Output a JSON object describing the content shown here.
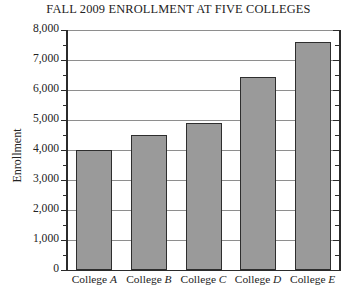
{
  "chart_data": {
    "type": "bar",
    "title": "FALL 2009 ENROLLMENT AT FIVE COLLEGES",
    "xlabel": "",
    "ylabel": "Enrollment",
    "categories": [
      "College A",
      "College B",
      "College C",
      "College D",
      "College E"
    ],
    "category_prefix": "College",
    "category_letters": [
      "A",
      "B",
      "C",
      "D",
      "E"
    ],
    "values": [
      4000,
      4500,
      4900,
      6450,
      7600
    ],
    "ylim": [
      0,
      8000
    ],
    "y_major_step": 1000,
    "y_minor_step": 500,
    "y_tick_labels": [
      "0",
      "1,000",
      "2,000",
      "3,000",
      "4,000",
      "5,000",
      "6,000",
      "7,000",
      "8,000"
    ],
    "y_tick_values": [
      0,
      1000,
      2000,
      3000,
      4000,
      5000,
      6000,
      7000,
      8000
    ],
    "grid": true,
    "grid_axis": "y",
    "legend": false,
    "bar_fill_color": "#9a9a9a",
    "bar_edge_color": "#2e2e2e",
    "grid_color": "#8e8e8e",
    "axis_color": "#2b2b2b",
    "background_color": "#ffffff"
  }
}
